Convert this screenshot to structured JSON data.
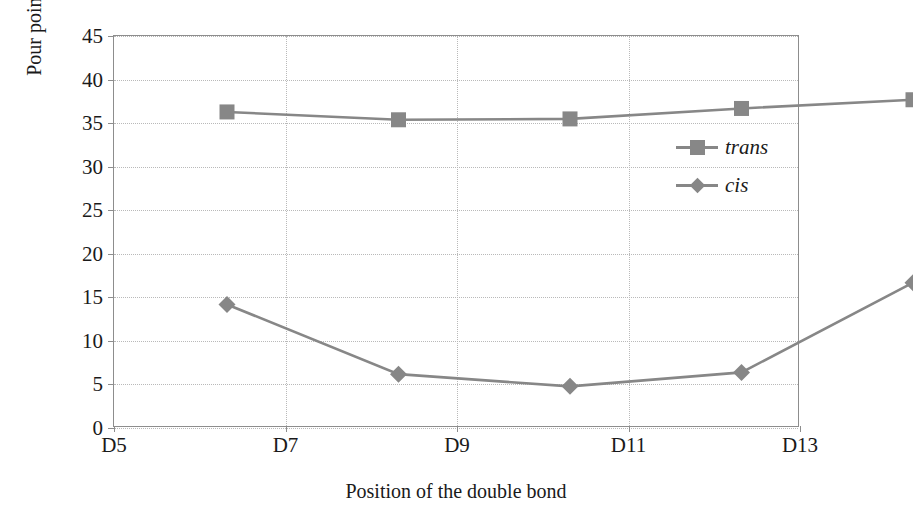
{
  "chart_data": {
    "type": "line",
    "title": "",
    "xlabel": "Position of the double bond",
    "ylabel": "Pour point (°C)",
    "categories": [
      "D5",
      "D7",
      "D9",
      "D11",
      "D13"
    ],
    "ylim": [
      0,
      45
    ],
    "yticks": [
      0,
      5,
      10,
      15,
      20,
      25,
      30,
      35,
      40,
      45
    ],
    "ytick_labels": [
      "0",
      "5",
      "10",
      "15",
      "20",
      "25",
      "30",
      "35",
      "40",
      "45"
    ],
    "grid": "horizontal-and-vertical-dotted",
    "legend_position": "inside-right-upper",
    "series": [
      {
        "name": "trans",
        "marker": "square",
        "color": "#878787",
        "values": [
          40.3,
          39.4,
          39.5,
          40.7,
          41.7
        ]
      },
      {
        "name": "cis",
        "marker": "diamond",
        "color": "#878787",
        "values": [
          18.2,
          10.2,
          8.8,
          10.4,
          20.7
        ]
      }
    ]
  },
  "colors": {
    "series": "#878787",
    "axis": "#8d8d8d",
    "grid": "#b9b9b9",
    "text": "#1a1a1a",
    "background": "#ffffff"
  },
  "legend": {
    "items": [
      {
        "label": "trans",
        "marker": "square-marker-icon"
      },
      {
        "label": "cis",
        "marker": "diamond-marker-icon"
      }
    ]
  }
}
